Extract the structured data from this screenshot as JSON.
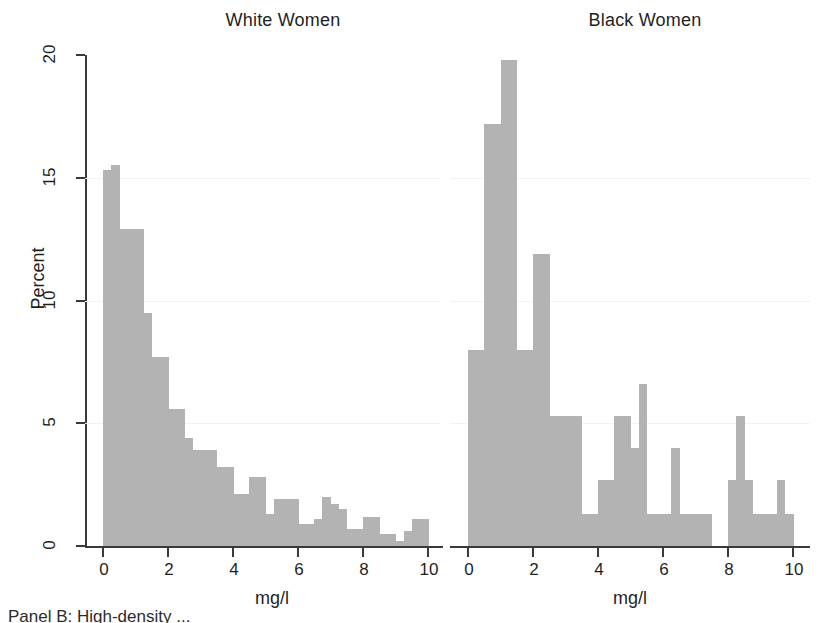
{
  "figure": {
    "caption_fragment": "Panel B: High-density ..."
  },
  "axis": {
    "y_title": "Percent",
    "y_ticks": [
      "0",
      "5",
      "10",
      "15",
      "20"
    ],
    "x_ticks": [
      "0",
      "2",
      "4",
      "6",
      "8",
      "10"
    ],
    "x_title_left": "mg/l",
    "x_title_right": "mg/l"
  },
  "panels": {
    "left_title": "White Women",
    "right_title": "Black Women"
  },
  "chart_data": [
    {
      "type": "bar",
      "title": "White Women",
      "xlabel": "mg/l",
      "ylabel": "Percent",
      "xlim": [
        0,
        10
      ],
      "ylim": [
        0,
        20
      ],
      "xtick_values": [
        0,
        2,
        4,
        6,
        8,
        10
      ],
      "ytick_values": [
        0,
        5,
        10,
        15,
        20
      ],
      "grid": false,
      "bin_width": 0.25,
      "bar_color": "#b3b3b3",
      "bin_starts": [
        0,
        0.25,
        0.5,
        0.75,
        1.0,
        1.25,
        1.5,
        1.75,
        2.0,
        2.25,
        2.5,
        2.75,
        3.0,
        3.25,
        3.5,
        3.75,
        4.0,
        4.25,
        4.5,
        4.75,
        5.0,
        5.25,
        5.5,
        5.75,
        6.0,
        6.25,
        6.5,
        6.75,
        7.0,
        7.25,
        7.5,
        7.75,
        8.0,
        8.25,
        8.5,
        8.75,
        9.0,
        9.25,
        9.5,
        9.75
      ],
      "values": [
        15.3,
        15.5,
        12.9,
        12.9,
        12.9,
        9.5,
        7.7,
        7.7,
        5.6,
        5.6,
        4.4,
        3.9,
        3.9,
        3.9,
        3.2,
        3.2,
        2.1,
        2.1,
        2.8,
        2.8,
        1.3,
        1.9,
        1.9,
        1.9,
        0.9,
        0.9,
        1.1,
        2.0,
        1.7,
        1.5,
        0.7,
        0.7,
        1.2,
        1.2,
        0.5,
        0.5,
        0.2,
        0.6,
        1.1,
        1.1
      ]
    },
    {
      "type": "bar",
      "title": "Black Women",
      "xlabel": "mg/l",
      "ylabel": "Percent",
      "xlim": [
        0,
        10
      ],
      "ylim": [
        0,
        20
      ],
      "xtick_values": [
        0,
        2,
        4,
        6,
        8,
        10
      ],
      "ytick_values": [
        0,
        5,
        10,
        15,
        20
      ],
      "grid": false,
      "bin_width": 0.25,
      "bar_color": "#b3b3b3",
      "bin_starts": [
        0,
        0.25,
        0.5,
        0.75,
        1.0,
        1.25,
        1.5,
        1.75,
        2.0,
        2.25,
        2.5,
        2.75,
        3.0,
        3.25,
        3.5,
        3.75,
        4.0,
        4.25,
        4.5,
        4.75,
        5.0,
        5.25,
        5.5,
        5.75,
        6.0,
        6.25,
        6.5,
        6.75,
        7.0,
        7.25,
        7.5,
        7.75,
        8.0,
        8.25,
        8.5,
        8.75,
        9.0,
        9.25,
        9.5,
        9.75
      ],
      "values": [
        8.0,
        8.0,
        17.2,
        17.2,
        19.8,
        19.8,
        8.0,
        8.0,
        11.9,
        11.9,
        5.3,
        5.3,
        5.3,
        5.3,
        1.3,
        1.3,
        2.7,
        2.7,
        5.3,
        5.3,
        4.0,
        6.6,
        1.3,
        1.3,
        1.3,
        4.0,
        1.3,
        1.3,
        1.3,
        1.3,
        0.0,
        0.0,
        2.7,
        5.3,
        2.7,
        1.3,
        1.3,
        1.3,
        2.7,
        1.3
      ]
    }
  ]
}
